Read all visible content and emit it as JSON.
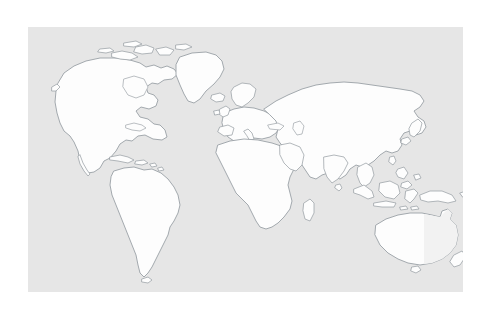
{
  "document": {
    "type": "world-map-outline",
    "title": "",
    "background_color": "#ffffff"
  },
  "canvas": {
    "width": 492,
    "height": 312,
    "background_color": "#ffffff"
  },
  "map_panel": {
    "x": 28,
    "y": 27,
    "width": 435,
    "height": 265,
    "background_color": "#e6e6e6",
    "land_fill_color": "#fdfdfd",
    "land_stroke_color": "#9aa0a6",
    "projection_center": "Europe-Africa",
    "label": ""
  },
  "legend": {
    "visible": false,
    "entries": []
  },
  "labels": {
    "visible": false,
    "items": []
  },
  "landmasses": [
    {
      "name": "north-america",
      "label": ""
    },
    {
      "name": "greenland",
      "label": ""
    },
    {
      "name": "south-america",
      "label": ""
    },
    {
      "name": "africa",
      "label": ""
    },
    {
      "name": "europe",
      "label": ""
    },
    {
      "name": "asia",
      "label": ""
    },
    {
      "name": "india",
      "label": ""
    },
    {
      "name": "arabia",
      "label": ""
    },
    {
      "name": "southeast-asia",
      "label": ""
    },
    {
      "name": "indonesia",
      "label": ""
    },
    {
      "name": "philippines",
      "label": ""
    },
    {
      "name": "japan",
      "label": ""
    },
    {
      "name": "new-guinea",
      "label": ""
    },
    {
      "name": "australia",
      "label": ""
    },
    {
      "name": "new-zealand",
      "label": ""
    },
    {
      "name": "madagascar",
      "label": ""
    },
    {
      "name": "british-isles",
      "label": ""
    },
    {
      "name": "iceland",
      "label": ""
    },
    {
      "name": "caribbean",
      "label": ""
    },
    {
      "name": "sri-lanka",
      "label": ""
    },
    {
      "name": "taiwan",
      "label": ""
    },
    {
      "name": "arctic-islands",
      "label": ""
    }
  ]
}
